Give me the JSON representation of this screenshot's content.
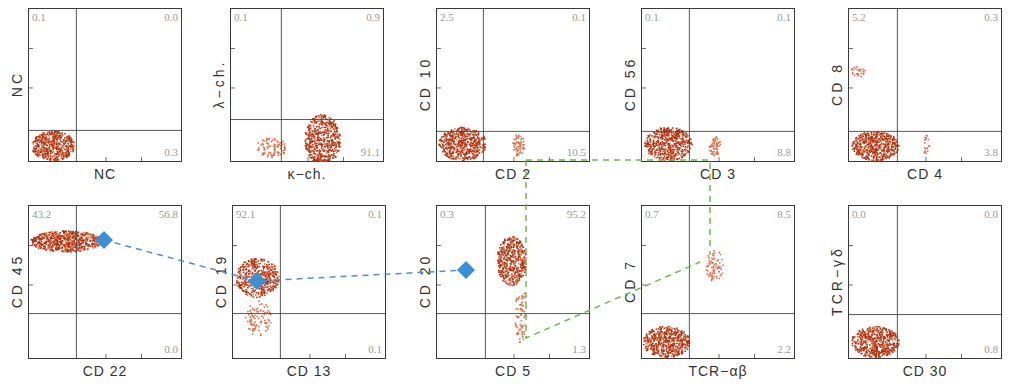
{
  "chart_data": {
    "type": "scatter",
    "title": "",
    "colors": {
      "dots": "#b83a14",
      "dots_light": "#e07050",
      "marker": "#3a8fd6",
      "blue_line": "#4a90d9",
      "green_line": "#6fba4a"
    },
    "panels": [
      {
        "id": "p1",
        "xlabel": "NC",
        "ylabel": "NC",
        "quadrants": {
          "tl": "0.1",
          "tr": "0.0",
          "br": "0.3"
        }
      },
      {
        "id": "p2",
        "xlabel": "κ−ch.",
        "ylabel": "λ−ch.",
        "quadrants": {
          "tl": "0.1",
          "tr": "0.9",
          "br": "91.1"
        }
      },
      {
        "id": "p3",
        "xlabel": "CD 2",
        "ylabel": "CD 10",
        "quadrants": {
          "tl": "2.5",
          "tr": "0.1",
          "br": "10.5"
        }
      },
      {
        "id": "p4",
        "xlabel": "CD 3",
        "ylabel": "CD 56",
        "quadrants": {
          "tl": "0.1",
          "tr": "0.1",
          "br": "8.8"
        }
      },
      {
        "id": "p5",
        "xlabel": "CD 4",
        "ylabel": "CD 8",
        "quadrants": {
          "tl": "5.2",
          "tr": "0.3",
          "br": "3.8"
        }
      },
      {
        "id": "p6",
        "xlabel": "CD 22",
        "ylabel": "CD 45",
        "quadrants": {
          "tl": "43.2",
          "tr": "56.8",
          "br": "0.0"
        }
      },
      {
        "id": "p7",
        "xlabel": "CD 13",
        "ylabel": "CD 19",
        "quadrants": {
          "tl": "92.1",
          "tr": "0.1",
          "br": "0.1"
        }
      },
      {
        "id": "p8",
        "xlabel": "CD 5",
        "ylabel": "CD 20",
        "quadrants": {
          "tl": "0.3",
          "tr": "95.2",
          "br": "1.3"
        }
      },
      {
        "id": "p9",
        "xlabel": "TCR−αβ",
        "ylabel": "CD 7",
        "quadrants": {
          "tl": "0.7",
          "tr": "8.5",
          "br": "2.2"
        }
      },
      {
        "id": "p10",
        "xlabel": "CD 30",
        "ylabel": "TCR−γδ",
        "quadrants": {
          "tl": "0.0",
          "tr": "0.0",
          "br": "0.8"
        }
      }
    ],
    "annotations": {
      "blue_markers": [
        {
          "x": 104,
          "y": 240
        },
        {
          "x": 257,
          "y": 281
        },
        {
          "x": 466,
          "y": 270
        }
      ],
      "green_path": "dashed connector linking CD2+ / CD3+ / CD5 / TCR-αβ populations"
    }
  }
}
